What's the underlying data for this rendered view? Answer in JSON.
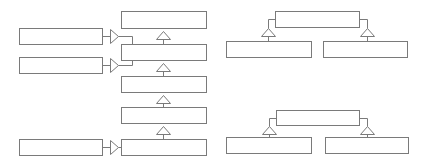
{
  "diagram": {
    "type": "uml-class-inheritance",
    "stroke_color": "#7a7a7a",
    "fill_color": "#ffffff",
    "stroke_width": 1,
    "boxes": [
      {
        "id": "chain-1",
        "label": "",
        "x": 121,
        "y": 11,
        "w": 85,
        "h": 17
      },
      {
        "id": "chain-2",
        "label": "",
        "x": 121,
        "y": 44,
        "w": 85,
        "h": 16
      },
      {
        "id": "chain-3",
        "label": "",
        "x": 121,
        "y": 76,
        "w": 85,
        "h": 16
      },
      {
        "id": "chain-4",
        "label": "",
        "x": 121,
        "y": 107,
        "w": 85,
        "h": 16
      },
      {
        "id": "chain-5",
        "label": "",
        "x": 121,
        "y": 139,
        "w": 85,
        "h": 16
      },
      {
        "id": "left-1",
        "label": "",
        "x": 19,
        "y": 28,
        "w": 83,
        "h": 16
      },
      {
        "id": "left-2",
        "label": "",
        "x": 19,
        "y": 57,
        "w": 83,
        "h": 16
      },
      {
        "id": "left-3",
        "label": "",
        "x": 19,
        "y": 139,
        "w": 83,
        "h": 16
      },
      {
        "id": "tr-parent",
        "label": "",
        "x": 275,
        "y": 11,
        "w": 84,
        "h": 16
      },
      {
        "id": "tr-child-left",
        "label": "",
        "x": 226,
        "y": 41,
        "w": 85,
        "h": 16
      },
      {
        "id": "tr-child-right",
        "label": "",
        "x": 323,
        "y": 41,
        "w": 84,
        "h": 16
      },
      {
        "id": "br-parent",
        "label": "",
        "x": 276,
        "y": 110,
        "w": 83,
        "h": 15
      },
      {
        "id": "br-child-left",
        "label": "",
        "x": 226,
        "y": 137,
        "w": 85,
        "h": 16
      },
      {
        "id": "br-child-right",
        "label": "",
        "x": 325,
        "y": 137,
        "w": 83,
        "h": 16
      }
    ],
    "up_arrows": [
      {
        "id": "gen-2-1",
        "cx": 163,
        "apex": 31,
        "base": 39,
        "line_to": 44
      },
      {
        "id": "gen-3-2",
        "cx": 163,
        "apex": 63,
        "base": 71,
        "line_to": 76
      },
      {
        "id": "gen-4-3",
        "cx": 163,
        "apex": 95,
        "base": 103,
        "line_to": 107
      },
      {
        "id": "gen-5-4",
        "cx": 163,
        "apex": 126,
        "base": 134,
        "line_to": 139
      }
    ],
    "right_arrows": [
      {
        "id": "real-left1",
        "y": 36,
        "from_x": 102,
        "tip_x": 118,
        "route": [
          [
            118,
            36
          ],
          [
            132,
            36
          ],
          [
            132,
            44
          ]
        ]
      },
      {
        "id": "real-left2",
        "y": 65,
        "from_x": 102,
        "tip_x": 118,
        "route": [
          [
            118,
            65
          ],
          [
            132,
            65
          ],
          [
            132,
            60
          ]
        ]
      },
      {
        "id": "real-left3",
        "y": 147,
        "from_x": 102,
        "tip_x": 118,
        "route": [
          [
            118,
            147
          ],
          [
            121,
            147
          ]
        ]
      }
    ],
    "branch_arrows": [
      {
        "id": "tr-left",
        "attach_x": 275,
        "attach_y": 19,
        "cx": 268,
        "apex": 28,
        "base": 36,
        "line_to": 41
      },
      {
        "id": "tr-right",
        "attach_x": 359,
        "attach_y": 19,
        "cx": 367,
        "apex": 28,
        "base": 36,
        "line_to": 41
      },
      {
        "id": "br-left",
        "attach_x": 276,
        "attach_y": 118,
        "cx": 269,
        "apex": 126,
        "base": 134,
        "line_to": 137
      },
      {
        "id": "br-right",
        "attach_x": 359,
        "attach_y": 118,
        "cx": 367,
        "apex": 126,
        "base": 134,
        "line_to": 137
      }
    ]
  }
}
